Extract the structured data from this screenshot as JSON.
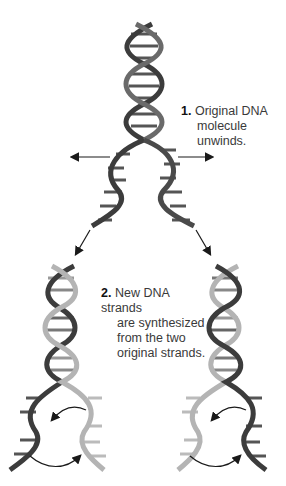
{
  "diagram": {
    "steps": [
      {
        "number": "1.",
        "line1": "Original DNA",
        "line2": "molecule unwinds."
      },
      {
        "number": "2.",
        "line1": "New DNA strands",
        "line2": "are synthesized",
        "line3": "from the two",
        "line4": "original strands."
      }
    ],
    "colors": {
      "original_strand": "#3c3c3c",
      "new_strand": "#b4b4b4",
      "arrow": "#1a1a1a",
      "background": "#ffffff"
    }
  }
}
